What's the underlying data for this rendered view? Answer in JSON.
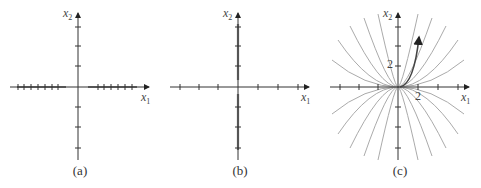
{
  "figure": {
    "panels": [
      {
        "id": "a",
        "caption": "(a)",
        "x_label": "x",
        "x_sub": "1",
        "y_label": "x",
        "y_sub": "2",
        "description": "Trajectories lie along the x1-axis (heavy tick-marked line segments on horizontal axis)"
      },
      {
        "id": "b",
        "caption": "(b)",
        "x_label": "x",
        "x_sub": "1",
        "y_label": "x",
        "y_sub": "2",
        "description": "Trajectories lie along the x2-axis (heavy tick-marked line on vertical axis)"
      },
      {
        "id": "c",
        "caption": "(c)",
        "x_label": "x",
        "x_sub": "1",
        "y_label": "x",
        "y_sub": "2",
        "tick_label_x": "2",
        "tick_label_y": "2",
        "description": "Family of curves through origin, one highlighted trajectory with arrow"
      }
    ],
    "colors": {
      "axis": "#333333",
      "curve": "#9a9a9a",
      "highlight": "#444444"
    }
  }
}
